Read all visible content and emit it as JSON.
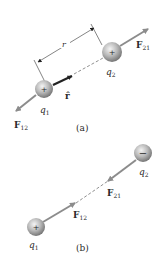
{
  "colors": {
    "force_arrow": "#8c8c8c",
    "sphere_light": "#f2f2f2",
    "sphere_mid": "#b5b5b5",
    "sphere_dark": "#7a7a7a",
    "line": "#333333",
    "text": "#2a2a2a"
  },
  "panel_a": {
    "caption": "(a)",
    "q1": {
      "label": "q",
      "sub": "1",
      "sign": "+"
    },
    "q2": {
      "label": "q",
      "sub": "2",
      "sign": "+"
    },
    "F12": {
      "label": "F",
      "sub": "12"
    },
    "F21": {
      "label": "F",
      "sub": "21"
    },
    "r_hat": {
      "label": "r̂"
    },
    "distance": {
      "label": "r"
    }
  },
  "panel_b": {
    "caption": "(b)",
    "q1": {
      "label": "q",
      "sub": "1",
      "sign": "+"
    },
    "q2": {
      "label": "q",
      "sub": "2",
      "sign": "−"
    },
    "F12": {
      "label": "F",
      "sub": "12"
    },
    "F21": {
      "label": "F",
      "sub": "21"
    }
  }
}
